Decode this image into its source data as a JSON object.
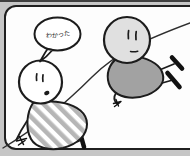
{
  "panel": {
    "type": "comic-panel",
    "speech_bubble": {
      "text": "わかった"
    },
    "scene": {
      "left_character": "striped-shirt-figure-sitting-on-slope",
      "right_character": "gray-shirt-figure-sliding-down-slope",
      "slope": "diagonal-line-bottom-left-to-top-right"
    }
  },
  "colors": {
    "outer_background": "#c6c6c6",
    "top_strip": "#3f3f3f",
    "panel_background": "#fdfdfd",
    "ink": "#1c1c1c",
    "stripe_gray": "#b6b6b6",
    "shirt_gray": "#a2a2a2",
    "head_gray": "#e0e0e0"
  }
}
